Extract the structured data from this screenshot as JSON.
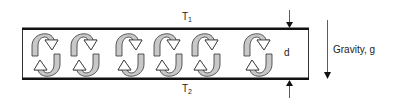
{
  "diagram": {
    "top_plate": {
      "label": "T",
      "subscript": "1"
    },
    "bottom_plate": {
      "label": "T",
      "subscript": "2"
    },
    "gap_label": "d",
    "gravity_label": "Gravity, g",
    "cells": [
      {
        "cx": 46
      },
      {
        "cx": 85
      },
      {
        "cx": 130
      },
      {
        "cx": 168
      },
      {
        "cx": 206
      },
      {
        "cx": 258
      }
    ],
    "colors": {
      "plate": "#111111",
      "wall": "#333333",
      "arrow_fill_gray": "#c8c8c8",
      "arrow_fill_white": "#ffffff",
      "arrow_stroke": "#333333"
    }
  }
}
